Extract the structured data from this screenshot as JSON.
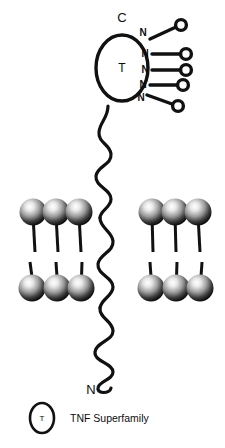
{
  "figure": {
    "background_color": "#ffffff",
    "stroke_color": "#111111",
    "width": 225,
    "height": 448
  },
  "termini": {
    "c_terminus_label": "C",
    "n_terminus_label": "N"
  },
  "domain": {
    "symbol": "T",
    "shape": "ellipse"
  },
  "glycosylation": {
    "site_label": "N",
    "sites": [
      {
        "id": "glycan-1",
        "label": "N",
        "angle": "up"
      },
      {
        "id": "glycan-2",
        "label": "N",
        "angle": "level"
      },
      {
        "id": "glycan-3",
        "label": "N",
        "angle": "level"
      },
      {
        "id": "glycan-4",
        "label": "N",
        "angle": "level"
      },
      {
        "id": "glycan-5",
        "label": "N",
        "angle": "down"
      }
    ],
    "count": 5
  },
  "membrane": {
    "left_leaflet_upper_count": 3,
    "left_leaflet_lower_count": 3,
    "right_leaflet_upper_count": 3,
    "right_leaflet_lower_count": 3,
    "head_fill_light": "#f2f2f2",
    "head_fill_dark": "#1a1a1a"
  },
  "legend": {
    "items": [
      {
        "symbol": "T",
        "label": "TNF Superfamily"
      }
    ]
  }
}
